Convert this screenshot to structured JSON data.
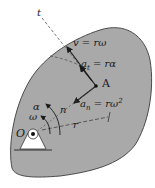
{
  "diagram": {
    "type": "rigid-body-rotation-kinematics",
    "colors": {
      "body_fill": "#a9a9a9",
      "body_edge": "#4a4a4a",
      "ink": "#1a1a1a",
      "dashed": "#555555",
      "background": "#ffffff"
    },
    "labels": {
      "tangent_axis": "t",
      "velocity": {
        "symbol": "v",
        "eq": " = rω"
      },
      "tangential_accel": {
        "symbol": "a",
        "sub": "t",
        "eq": " = rα"
      },
      "point": "A",
      "normal_accel": {
        "symbol": "a",
        "sub": "n",
        "eq": " = rω",
        "sup": "2"
      },
      "angular_accel": "α",
      "angular_velocity": "ω",
      "normal_axis": "n",
      "radius": "r",
      "pivot": "O"
    }
  }
}
